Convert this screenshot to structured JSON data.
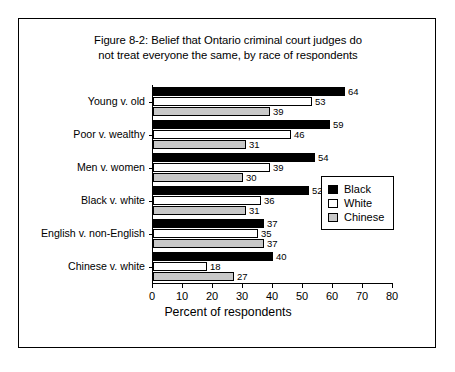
{
  "figure": {
    "title_line1": "Figure 8-2: Belief that Ontario criminal court judges do",
    "title_line2": "not treat everyone the same, by race of respondents"
  },
  "chart_data": {
    "type": "bar",
    "orientation": "horizontal",
    "title": "Figure 8-2: Belief that Ontario criminal court judges do not treat everyone the same, by race of respondents",
    "xlabel": "Percent of respondents",
    "ylabel": "",
    "xlim": [
      0,
      80
    ],
    "xticks": [
      0,
      10,
      20,
      30,
      40,
      50,
      60,
      70,
      80
    ],
    "grid": false,
    "legend_position": "center-right",
    "categories": [
      "Young v. old",
      "Poor v. wealthy",
      "Men v. women",
      "Black v. white",
      "English v. non-English",
      "Chinese v. white"
    ],
    "series": [
      {
        "name": "Black",
        "color": "#000000",
        "values": [
          64,
          59,
          54,
          52,
          37,
          40
        ]
      },
      {
        "name": "White",
        "color": "#ffffff",
        "values": [
          53,
          46,
          39,
          36,
          35,
          18
        ]
      },
      {
        "name": "Chinese",
        "color": "#c8c8c8",
        "values": [
          39,
          31,
          30,
          31,
          37,
          27
        ]
      }
    ]
  },
  "legend": {
    "items": [
      {
        "label": "Black",
        "color": "#000000"
      },
      {
        "label": "White",
        "color": "#ffffff"
      },
      {
        "label": "Chinese",
        "color": "#c8c8c8"
      }
    ]
  }
}
